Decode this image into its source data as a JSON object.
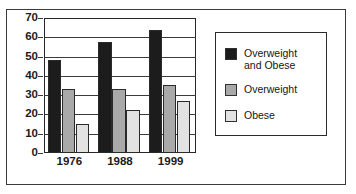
{
  "chart_data": {
    "type": "bar",
    "title": "",
    "xlabel": "",
    "ylabel": "",
    "categories": [
      "1976",
      "1988",
      "1999"
    ],
    "series": [
      {
        "name": "Overweight and Obese",
        "legend_label": "Overweight\nand Obese",
        "color": "#1c1c1c",
        "values": [
          48,
          57.5,
          64
        ]
      },
      {
        "name": "Overweight",
        "legend_label": "Overweight",
        "color": "#a9a9a9",
        "values": [
          33,
          33,
          35.5
        ]
      },
      {
        "name": "Obese",
        "legend_label": "Obese",
        "color": "#e2e2e2",
        "values": [
          15,
          22.5,
          27
        ]
      }
    ],
    "ylim": [
      0,
      70
    ],
    "ytick_labels": [
      "0",
      "10",
      "20",
      "30",
      "40",
      "50",
      "60",
      "70"
    ],
    "ytick_values": [
      0,
      10,
      20,
      30,
      40,
      50,
      60,
      70
    ],
    "grid": true,
    "legend_position": "right"
  },
  "colors": {
    "axis": "#262626",
    "grid": "#3b3b3b",
    "text": "#1c1c1c",
    "frame": "#3a3a3a",
    "legend_border": "#2b2b2b",
    "bar_border": "#2a2a2a",
    "background": "#ffffff"
  }
}
